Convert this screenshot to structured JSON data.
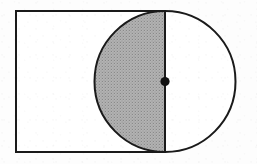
{
  "figure": {
    "background_color": "#fdfdfd",
    "stroke_color": "#1a1a1a",
    "shade_color": "#a8a8a8",
    "shade_pattern": "halftone-dither",
    "unshaded_fill": "#ffffff",
    "stroke_width": 2,
    "rectangle": {
      "name": "rectangle",
      "x": 16,
      "y": 11,
      "width": 149,
      "height": 141,
      "fill": "#ffffff",
      "stroke": "#1a1a1a"
    },
    "circle": {
      "name": "circle",
      "center_x": 165,
      "center_y": 81.5,
      "radius": 70.5,
      "fill": "#ffffff",
      "stroke": "#1a1a1a"
    },
    "shaded_region": {
      "name": "left-semicircle",
      "description": "Left half of the circle, lying inside the rectangle",
      "fill": "#a8a8a8"
    },
    "diameter_line": {
      "name": "vertical-diameter",
      "x": 165,
      "y1": 11,
      "y2": 152,
      "stroke": "#1a1a1a",
      "description": "Vertical diameter of the circle, coincident with the right side of the rectangle"
    },
    "center_point": {
      "name": "center-dot",
      "cx": 165,
      "cy": 81.5,
      "r": 4.6,
      "fill": "#111111"
    }
  }
}
